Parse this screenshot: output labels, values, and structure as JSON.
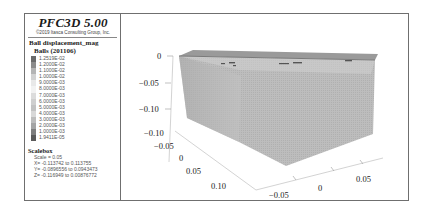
{
  "legend": {
    "title": "PFC3D 5.00",
    "copyright": "©2019 Itasca Consulting Group, Inc.",
    "heading": "Ball displacement_mag",
    "subheading": "Balls (201106)",
    "colorbar": {
      "labels": [
        "1.2519E-02",
        "1.2000E-02",
        "1.1000E-02",
        "1.0000E-02",
        "9.0000E-03",
        "8.0000E-03",
        "7.0000E-03",
        "6.0000E-03",
        "5.0000E-03",
        "4.0000E-03",
        "3.0000E-03",
        "2.0000E-03",
        "1.0000E-03",
        "1.9411E-05"
      ],
      "colors": [
        "#6a6a6a",
        "#8c8c8c",
        "#b4b4b4",
        "#d2d2d2",
        "#e8e8e8",
        "#f2f2f2",
        "#dcdcdc",
        "#cfcfcf",
        "#c2c2c2",
        "#d8d8d8",
        "#bcbcbc",
        "#a4a4a4",
        "#7e7e7e",
        "#5a5a5a"
      ]
    },
    "scalebox": {
      "heading": "Scalebox",
      "scale": "Scale = 0.05",
      "x_range": "X= -0.113742 to 0.113755",
      "y_range": "Y= -0.0896556 to 0.0943473",
      "z_range": "Z= -0.116949 to 0.00876772"
    }
  },
  "view": {
    "z_ticks": [
      "0",
      "−0.05",
      "−0.10"
    ],
    "x_ticks": [
      "−0.10",
      "−0.05",
      "0",
      "0.05",
      "0.10"
    ],
    "y_ticks": [
      "−0.05",
      "0",
      "0.05"
    ],
    "block_color": "#bdbdbd"
  }
}
